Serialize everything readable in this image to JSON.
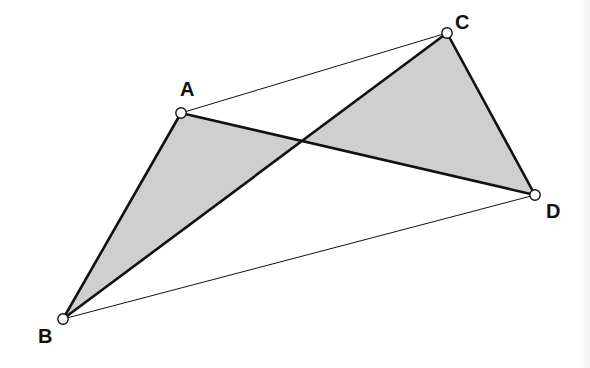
{
  "diagram": {
    "type": "geometry",
    "colors": {
      "background": "#ffffff",
      "stroke": "#111111",
      "shade": "#cfcfcf",
      "vertex_fill": "#ffffff"
    },
    "points": [
      {
        "id": "A",
        "label": "A",
        "x": 181,
        "y": 113,
        "label_x": 180,
        "label_y": 96
      },
      {
        "id": "B",
        "label": "B",
        "x": 63,
        "y": 319,
        "label_x": 38,
        "label_y": 343
      },
      {
        "id": "C",
        "label": "C",
        "x": 447,
        "y": 33,
        "label_x": 455,
        "label_y": 29
      },
      {
        "id": "D",
        "label": "D",
        "x": 535,
        "y": 195,
        "label_x": 546,
        "label_y": 218
      }
    ],
    "segments": [
      {
        "from": "A",
        "to": "B",
        "weight": "bold"
      },
      {
        "from": "B",
        "to": "C",
        "weight": "bold"
      },
      {
        "from": "A",
        "to": "D",
        "weight": "bold"
      },
      {
        "from": "C",
        "to": "D",
        "weight": "bold"
      },
      {
        "from": "A",
        "to": "C",
        "weight": "thin"
      },
      {
        "from": "B",
        "to": "D",
        "weight": "thin"
      }
    ],
    "shaded_regions": [
      {
        "name": "triangle-ABX",
        "vertices": [
          "A",
          "B",
          "X"
        ]
      },
      {
        "name": "triangle-CDX",
        "vertices": [
          "C",
          "D",
          "X"
        ]
      }
    ],
    "intersection": {
      "id": "X",
      "of": [
        "AD",
        "BC"
      ],
      "x": 303,
      "y": 141
    }
  }
}
